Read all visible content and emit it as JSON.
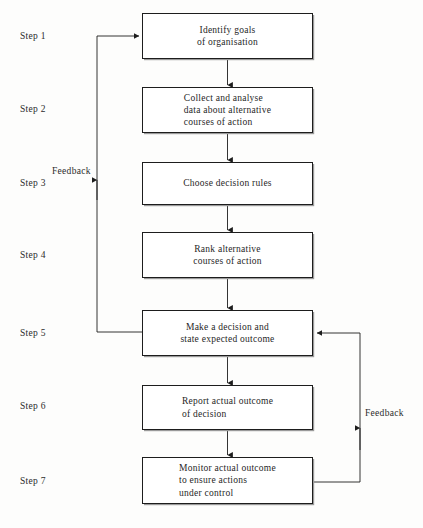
{
  "diagram": {
    "line_color": "#1d1d1d",
    "background": "#fdfdfc",
    "steps": [
      {
        "label": "Step 1",
        "text": "Identify goals\nof organisation",
        "align": "center",
        "box": {
          "x": 142,
          "y": 13,
          "w": 171,
          "h": 46
        },
        "label_y": 31
      },
      {
        "label": "Step 2",
        "text": "Collect and analyse\ndata about alternative\ncourses of action",
        "align": "left",
        "box": {
          "x": 142,
          "y": 87,
          "w": 171,
          "h": 46
        },
        "label_y": 104
      },
      {
        "label": "Step 3",
        "text": "Choose decision rules",
        "align": "center",
        "box": {
          "x": 142,
          "y": 162,
          "w": 171,
          "h": 43
        },
        "label_y": 178
      },
      {
        "label": "Step 4",
        "text": "Rank alternative\ncourses of action",
        "align": "center",
        "box": {
          "x": 142,
          "y": 232,
          "w": 171,
          "h": 46
        },
        "label_y": 250
      },
      {
        "label": "Step 5",
        "text": "Make a decision and\nstate expected outcome",
        "align": "center",
        "box": {
          "x": 142,
          "y": 310,
          "w": 171,
          "h": 46
        },
        "label_y": 328
      },
      {
        "label": "Step 6",
        "text": "Report actual outcome\nof decision",
        "align": "left",
        "box": {
          "x": 142,
          "y": 385,
          "w": 171,
          "h": 45
        },
        "label_y": 401
      },
      {
        "label": "Step 7",
        "text": "Monitor actual outcome\nto ensure actions\nunder control",
        "align": "left",
        "box": {
          "x": 142,
          "y": 457,
          "w": 171,
          "h": 47
        },
        "label_y": 476
      }
    ],
    "feedback_left": {
      "label": "Feedback",
      "label_x": 52,
      "label_y": 166
    },
    "feedback_right": {
      "label": "Feedback",
      "label_x": 365,
      "label_y": 408
    }
  }
}
